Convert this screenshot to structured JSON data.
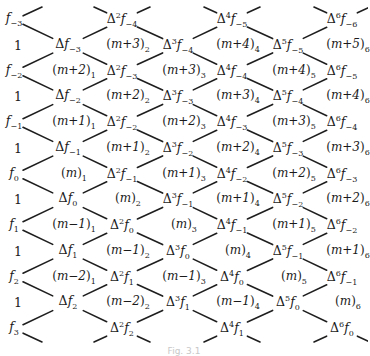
{
  "diagram": {
    "line_color": "#1e1e1e",
    "columns_x": [
      14,
      68,
      122,
      178,
      232,
      288,
      342
    ],
    "row0_y": 20,
    "row_step": 25.75,
    "nodes": [
      {
        "col": 0,
        "row": 0,
        "type": "f",
        "order": 0,
        "sub": "-3"
      },
      {
        "col": 0,
        "row": 2,
        "type": "f",
        "order": 0,
        "sub": "-2"
      },
      {
        "col": 0,
        "row": 4,
        "type": "f",
        "order": 0,
        "sub": "-1"
      },
      {
        "col": 0,
        "row": 6,
        "type": "f",
        "order": 0,
        "sub": "0"
      },
      {
        "col": 0,
        "row": 8,
        "type": "f",
        "order": 0,
        "sub": "1"
      },
      {
        "col": 0,
        "row": 10,
        "type": "f",
        "order": 0,
        "sub": "2"
      },
      {
        "col": 0,
        "row": 12,
        "type": "f",
        "order": 0,
        "sub": "3"
      },
      {
        "col": 1,
        "row": 1,
        "type": "d",
        "order": 1,
        "sub": "-3"
      },
      {
        "col": 1,
        "row": 3,
        "type": "d",
        "order": 1,
        "sub": "-2"
      },
      {
        "col": 1,
        "row": 5,
        "type": "d",
        "order": 1,
        "sub": "-1"
      },
      {
        "col": 1,
        "row": 7,
        "type": "d",
        "order": 1,
        "sub": "0"
      },
      {
        "col": 1,
        "row": 9,
        "type": "d",
        "order": 1,
        "sub": "1"
      },
      {
        "col": 1,
        "row": 11,
        "type": "d",
        "order": 1,
        "sub": "2"
      },
      {
        "col": 2,
        "row": 0,
        "type": "d",
        "order": 2,
        "sub": "-4"
      },
      {
        "col": 2,
        "row": 2,
        "type": "d",
        "order": 2,
        "sub": "-3"
      },
      {
        "col": 2,
        "row": 4,
        "type": "d",
        "order": 2,
        "sub": "-2"
      },
      {
        "col": 2,
        "row": 6,
        "type": "d",
        "order": 2,
        "sub": "-1"
      },
      {
        "col": 2,
        "row": 8,
        "type": "d",
        "order": 2,
        "sub": "0"
      },
      {
        "col": 2,
        "row": 10,
        "type": "d",
        "order": 2,
        "sub": "1"
      },
      {
        "col": 2,
        "row": 12,
        "type": "d",
        "order": 2,
        "sub": "2"
      },
      {
        "col": 3,
        "row": 1,
        "type": "d",
        "order": 3,
        "sub": "-4"
      },
      {
        "col": 3,
        "row": 3,
        "type": "d",
        "order": 3,
        "sub": "-3"
      },
      {
        "col": 3,
        "row": 5,
        "type": "d",
        "order": 3,
        "sub": "-2"
      },
      {
        "col": 3,
        "row": 7,
        "type": "d",
        "order": 3,
        "sub": "-1"
      },
      {
        "col": 3,
        "row": 9,
        "type": "d",
        "order": 3,
        "sub": "0"
      },
      {
        "col": 3,
        "row": 11,
        "type": "d",
        "order": 3,
        "sub": "1"
      },
      {
        "col": 4,
        "row": 0,
        "type": "d",
        "order": 4,
        "sub": "-5"
      },
      {
        "col": 4,
        "row": 2,
        "type": "d",
        "order": 4,
        "sub": "-4"
      },
      {
        "col": 4,
        "row": 4,
        "type": "d",
        "order": 4,
        "sub": "-3"
      },
      {
        "col": 4,
        "row": 6,
        "type": "d",
        "order": 4,
        "sub": "-2"
      },
      {
        "col": 4,
        "row": 8,
        "type": "d",
        "order": 4,
        "sub": "-1"
      },
      {
        "col": 4,
        "row": 10,
        "type": "d",
        "order": 4,
        "sub": "0"
      },
      {
        "col": 4,
        "row": 12,
        "type": "d",
        "order": 4,
        "sub": "1"
      },
      {
        "col": 5,
        "row": 1,
        "type": "d",
        "order": 5,
        "sub": "-5"
      },
      {
        "col": 5,
        "row": 3,
        "type": "d",
        "order": 5,
        "sub": "-4"
      },
      {
        "col": 5,
        "row": 5,
        "type": "d",
        "order": 5,
        "sub": "-3"
      },
      {
        "col": 5,
        "row": 7,
        "type": "d",
        "order": 5,
        "sub": "-2"
      },
      {
        "col": 5,
        "row": 9,
        "type": "d",
        "order": 5,
        "sub": "-1"
      },
      {
        "col": 5,
        "row": 11,
        "type": "d",
        "order": 5,
        "sub": "0"
      },
      {
        "col": 6,
        "row": 0,
        "type": "d",
        "order": 6,
        "sub": "-6"
      },
      {
        "col": 6,
        "row": 2,
        "type": "d",
        "order": 6,
        "sub": "-5"
      },
      {
        "col": 6,
        "row": 4,
        "type": "d",
        "order": 6,
        "sub": "-4"
      },
      {
        "col": 6,
        "row": 6,
        "type": "d",
        "order": 6,
        "sub": "-3"
      },
      {
        "col": 6,
        "row": 8,
        "type": "d",
        "order": 6,
        "sub": "-2"
      },
      {
        "col": 6,
        "row": 10,
        "type": "d",
        "order": 6,
        "sub": "-1"
      },
      {
        "col": 6,
        "row": 12,
        "type": "d",
        "order": 6,
        "sub": "0"
      }
    ],
    "ones": [
      {
        "col": 0,
        "row": 1,
        "text": "1"
      },
      {
        "col": 0,
        "row": 3,
        "text": "1"
      },
      {
        "col": 0,
        "row": 5,
        "text": "1"
      },
      {
        "col": 0,
        "row": 7,
        "text": "1"
      },
      {
        "col": 0,
        "row": 9,
        "text": "1"
      },
      {
        "col": 0,
        "row": 11,
        "text": "1"
      }
    ],
    "coefficients": [
      {
        "col": 1,
        "row": 2,
        "expr": "m+2",
        "sub": "1"
      },
      {
        "col": 1,
        "row": 4,
        "expr": "m+1",
        "sub": "1"
      },
      {
        "col": 1,
        "row": 6,
        "expr": "m",
        "sub": "1"
      },
      {
        "col": 1,
        "row": 8,
        "expr": "m−1",
        "sub": "1"
      },
      {
        "col": 1,
        "row": 10,
        "expr": "m−2",
        "sub": "1"
      },
      {
        "col": 2,
        "row": 1,
        "expr": "m+3",
        "sub": "2"
      },
      {
        "col": 2,
        "row": 3,
        "expr": "m+2",
        "sub": "2"
      },
      {
        "col": 2,
        "row": 5,
        "expr": "m+1",
        "sub": "2"
      },
      {
        "col": 2,
        "row": 7,
        "expr": "m",
        "sub": "2"
      },
      {
        "col": 2,
        "row": 9,
        "expr": "m−1",
        "sub": "2"
      },
      {
        "col": 2,
        "row": 11,
        "expr": "m−2",
        "sub": "2"
      },
      {
        "col": 3,
        "row": 2,
        "expr": "m+3",
        "sub": "3"
      },
      {
        "col": 3,
        "row": 4,
        "expr": "m+2",
        "sub": "3"
      },
      {
        "col": 3,
        "row": 6,
        "expr": "m+1",
        "sub": "3"
      },
      {
        "col": 3,
        "row": 8,
        "expr": "m",
        "sub": "3"
      },
      {
        "col": 3,
        "row": 10,
        "expr": "m−1",
        "sub": "3"
      },
      {
        "col": 4,
        "row": 1,
        "expr": "m+4",
        "sub": "4"
      },
      {
        "col": 4,
        "row": 3,
        "expr": "m+3",
        "sub": "4"
      },
      {
        "col": 4,
        "row": 5,
        "expr": "m+2",
        "sub": "4"
      },
      {
        "col": 4,
        "row": 7,
        "expr": "m+1",
        "sub": "4"
      },
      {
        "col": 4,
        "row": 9,
        "expr": "m",
        "sub": "4"
      },
      {
        "col": 4,
        "row": 11,
        "expr": "m−1",
        "sub": "4"
      },
      {
        "col": 5,
        "row": 2,
        "expr": "m+4",
        "sub": "5"
      },
      {
        "col": 5,
        "row": 4,
        "expr": "m+3",
        "sub": "5"
      },
      {
        "col": 5,
        "row": 6,
        "expr": "m+2",
        "sub": "5"
      },
      {
        "col": 5,
        "row": 8,
        "expr": "m+1",
        "sub": "5"
      },
      {
        "col": 5,
        "row": 10,
        "expr": "m",
        "sub": "5"
      },
      {
        "col": 6,
        "row": 1,
        "expr": "m+5",
        "sub": "6"
      },
      {
        "col": 6,
        "row": 3,
        "expr": "m+4",
        "sub": "6"
      },
      {
        "col": 6,
        "row": 5,
        "expr": "m+3",
        "sub": "6"
      },
      {
        "col": 6,
        "row": 7,
        "expr": "m+2",
        "sub": "6"
      },
      {
        "col": 6,
        "row": 9,
        "expr": "m+1",
        "sub": "6"
      },
      {
        "col": 6,
        "row": 11,
        "expr": "m",
        "sub": "6"
      }
    ]
  },
  "caption": "Fig. 3.1"
}
